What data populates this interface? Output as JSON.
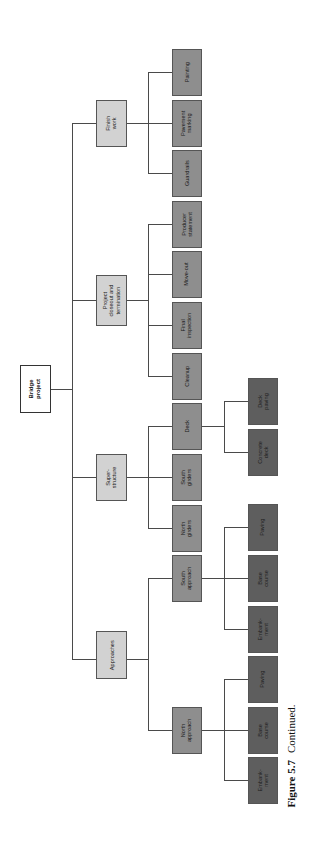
{
  "diagram": {
    "type": "work-breakdown-structure",
    "orientation": "rotated-90-ccw",
    "root": {
      "label": "Bridge\nproject"
    },
    "level1": [
      {
        "label": "Finish\nwork"
      },
      {
        "label": "Project\ncloseout and\ntermination"
      },
      {
        "label": "Super-\nstructure"
      },
      {
        "label": "Approaches"
      }
    ],
    "level2": [
      {
        "label": "Painting",
        "parent": "Finish work"
      },
      {
        "label": "Pavement\nmarking",
        "parent": "Finish work"
      },
      {
        "label": "Guardrails",
        "parent": "Finish work"
      },
      {
        "label": "Producer\nstatement",
        "parent": "Project closeout and termination"
      },
      {
        "label": "Move-out",
        "parent": "Project closeout and termination"
      },
      {
        "label": "Final\ninspection",
        "parent": "Project closeout and termination"
      },
      {
        "label": "Cleanup",
        "parent": "Project closeout and termination"
      },
      {
        "label": "Deck",
        "parent": "Super-structure"
      },
      {
        "label": "South\ngirders",
        "parent": "Super-structure"
      },
      {
        "label": "North\ngirders",
        "parent": "Super-structure"
      },
      {
        "label": "South\napproach",
        "parent": "Approaches"
      },
      {
        "label": "North\napproach",
        "parent": "Approaches"
      }
    ],
    "level3": [
      {
        "label": "Deck\npaving",
        "parent": "Deck"
      },
      {
        "label": "Concrete\ndeck",
        "parent": "Deck"
      },
      {
        "label": "Paving",
        "parent": "South approach"
      },
      {
        "label": "Base\ncourse",
        "parent": "South approach"
      },
      {
        "label": "Embank-\nment",
        "parent": "South approach"
      },
      {
        "label": "Paving",
        "parent": "North approach"
      },
      {
        "label": "Base\ncourse",
        "parent": "North approach"
      },
      {
        "label": "Embank-\nment",
        "parent": "North approach"
      }
    ],
    "colors": {
      "root": "#ffffff",
      "level1": "#d2d2d2",
      "level2": "#8e8e8e",
      "level3": "#5e5e5e",
      "connector": "#4a4a4a"
    }
  },
  "caption": {
    "figure": "Figure 5.7",
    "text": "Continued."
  }
}
